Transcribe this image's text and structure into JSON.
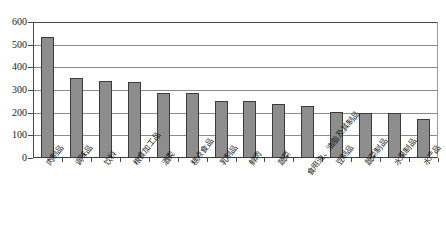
{
  "chart_data": {
    "type": "bar",
    "title": "",
    "subtitle": "",
    "xlabel": "",
    "ylabel": "",
    "ylim": [
      0,
      600
    ],
    "ytick_interval": 100,
    "yticks": [
      "0",
      "100",
      "200",
      "300",
      "400",
      "500",
      "600"
    ],
    "grid": true,
    "legend": false,
    "bar_color": "#8d8d8d",
    "bar_border_color": "#3b3b3b",
    "gridline_color": "#8a8a8a",
    "axis_color": "#4a4a4a",
    "categories": [
      "肉制品",
      "调味品",
      "饮料",
      "粮食加工品",
      "酒类",
      "糕点食品",
      "乳制品",
      "鲜肉",
      "蔬菜",
      "食用油、油脂及其制品",
      "豆制品",
      "蔬菜制品",
      "水果制品",
      "水产品"
    ],
    "values": [
      535,
      355,
      340,
      335,
      285,
      285,
      250,
      250,
      240,
      230,
      205,
      200,
      200,
      170
    ]
  }
}
